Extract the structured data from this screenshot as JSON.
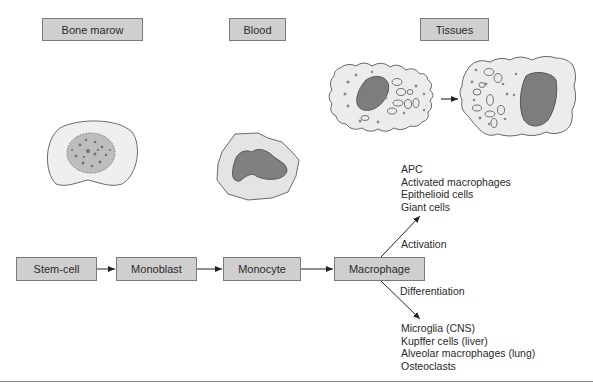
{
  "diagram": {
    "type": "flowchart",
    "stage_headers": [
      {
        "id": "bone-marrow",
        "label": "Bone marow"
      },
      {
        "id": "blood",
        "label": "Blood"
      },
      {
        "id": "tissues",
        "label": "Tissues"
      }
    ],
    "flow_nodes": [
      {
        "id": "stem-cell",
        "label": "Stem-cell"
      },
      {
        "id": "monoblast",
        "label": "Monoblast"
      },
      {
        "id": "monocyte",
        "label": "Monocyte"
      },
      {
        "id": "macrophage",
        "label": "Macrophage"
      }
    ],
    "edges": [
      {
        "from": "stem-cell",
        "to": "monoblast"
      },
      {
        "from": "monoblast",
        "to": "monocyte"
      },
      {
        "from": "monocyte",
        "to": "macrophage"
      },
      {
        "from": "macrophage",
        "to": "activation-outcomes",
        "label": "Activation"
      },
      {
        "from": "macrophage",
        "to": "differentiation-outcomes",
        "label": "Differentiation"
      }
    ],
    "branches": {
      "activation": {
        "label": "Activation",
        "outcomes": [
          "APC",
          "Activated macrophages",
          "Epithelioid cells",
          "Giant cells"
        ]
      },
      "differentiation": {
        "label": "Differentiation",
        "outcomes": [
          "Microglia (CNS)",
          "Kupffer cells (liver)",
          "Alveolar macrophages (lung)",
          "Osteoclasts"
        ]
      }
    },
    "illustrations": [
      {
        "id": "stem-cell-illustration",
        "stage": "bone-marrow"
      },
      {
        "id": "monocyte-illustration",
        "stage": "blood"
      },
      {
        "id": "tissue-macrophage-1",
        "stage": "tissues"
      },
      {
        "id": "tissue-macrophage-2",
        "stage": "tissues"
      }
    ],
    "colors": {
      "box_fill": "#cfcfcf",
      "box_border": "#7a7a7a",
      "cytoplasm": "#ebebeb",
      "nucleus": "#7d7d7d",
      "line": "#222222"
    }
  }
}
